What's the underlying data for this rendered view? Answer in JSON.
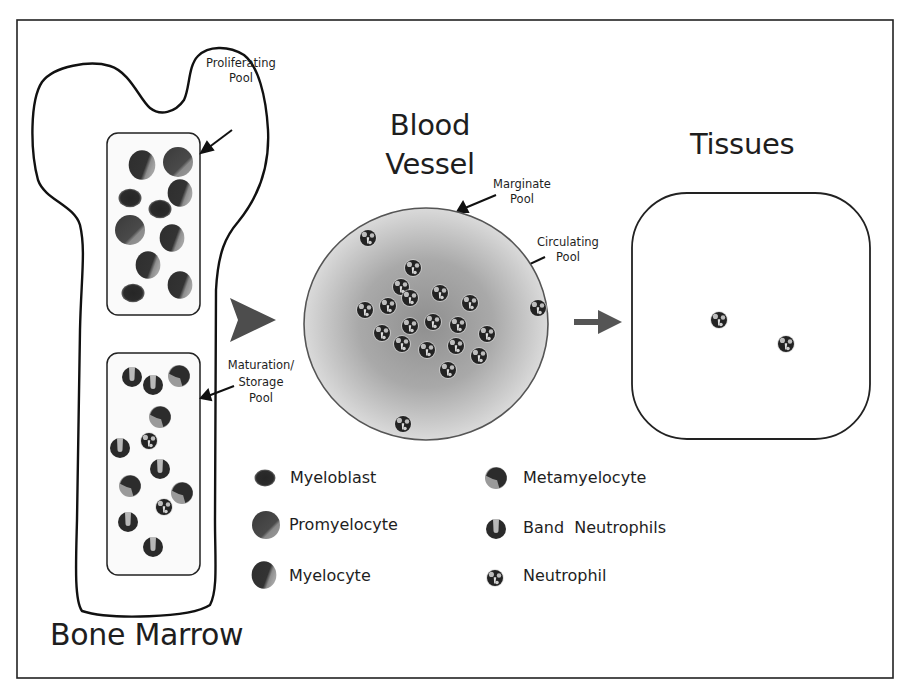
{
  "colors": {
    "outline": "#111111",
    "arrow_fill": "#555555",
    "vessel_center": "#9a9a9a",
    "vessel_edge": "#d9d9d9",
    "cell_dark": "#2a2a2a",
    "cell_light": "#a8a8a8"
  },
  "compartments": {
    "bone_marrow": {
      "title": "Bone Marrow",
      "proliferating_pool": {
        "label_line1": "Proliferating",
        "label_line2": "Pool",
        "cells": [
          {
            "type": "myelocyte",
            "x": 142,
            "y": 165,
            "r": 14
          },
          {
            "type": "promyelocyte",
            "x": 178,
            "y": 162,
            "r": 15
          },
          {
            "type": "myelocyte",
            "x": 180,
            "y": 193,
            "r": 13
          },
          {
            "type": "myeloblast",
            "x": 130,
            "y": 198,
            "r": 11
          },
          {
            "type": "myeloblast",
            "x": 160,
            "y": 209,
            "r": 11
          },
          {
            "type": "promyelocyte",
            "x": 130,
            "y": 230,
            "r": 15
          },
          {
            "type": "myelocyte",
            "x": 172,
            "y": 238,
            "r": 13
          },
          {
            "type": "myelocyte",
            "x": 148,
            "y": 265,
            "r": 13
          },
          {
            "type": "myelocyte",
            "x": 180,
            "y": 285,
            "r": 13
          },
          {
            "type": "myeloblast",
            "x": 133,
            "y": 293,
            "r": 11
          }
        ]
      },
      "maturation_pool": {
        "label_line1": "Maturation/",
        "label_line2": "Storage",
        "label_line3": "Pool",
        "cells": [
          {
            "type": "band",
            "x": 132,
            "y": 377,
            "r": 10
          },
          {
            "type": "band",
            "x": 153,
            "y": 385,
            "r": 10
          },
          {
            "type": "metamyelocyte",
            "x": 179,
            "y": 376,
            "r": 11
          },
          {
            "type": "metamyelocyte",
            "x": 160,
            "y": 417,
            "r": 11
          },
          {
            "type": "band",
            "x": 120,
            "y": 448,
            "r": 10
          },
          {
            "type": "neutrophil",
            "x": 149,
            "y": 441,
            "r": 8
          },
          {
            "type": "band",
            "x": 160,
            "y": 469,
            "r": 10
          },
          {
            "type": "metamyelocyte",
            "x": 130,
            "y": 486,
            "r": 11
          },
          {
            "type": "metamyelocyte",
            "x": 182,
            "y": 493,
            "r": 11
          },
          {
            "type": "neutrophil",
            "x": 164,
            "y": 507,
            "r": 8
          },
          {
            "type": "band",
            "x": 128,
            "y": 522,
            "r": 10
          },
          {
            "type": "band",
            "x": 153,
            "y": 547,
            "r": 10
          }
        ]
      }
    },
    "blood_vessel": {
      "title_line1": "Blood",
      "title_line2": "Vessel",
      "marginate_label_line1": "Marginate",
      "marginate_label_line2": "Pool",
      "circulating_label_line1": "Circulating",
      "circulating_label_line2": "Pool",
      "cells": [
        {
          "type": "neutrophil",
          "x": 368,
          "y": 238,
          "r": 8
        },
        {
          "type": "neutrophil",
          "x": 413,
          "y": 268,
          "r": 8
        },
        {
          "type": "neutrophil",
          "x": 401,
          "y": 287,
          "r": 8
        },
        {
          "type": "neutrophil",
          "x": 410,
          "y": 298,
          "r": 8
        },
        {
          "type": "neutrophil",
          "x": 440,
          "y": 293,
          "r": 8
        },
        {
          "type": "neutrophil",
          "x": 470,
          "y": 303,
          "r": 8
        },
        {
          "type": "neutrophil",
          "x": 365,
          "y": 310,
          "r": 8
        },
        {
          "type": "neutrophil",
          "x": 388,
          "y": 306,
          "r": 8
        },
        {
          "type": "neutrophil",
          "x": 410,
          "y": 326,
          "r": 8
        },
        {
          "type": "neutrophil",
          "x": 433,
          "y": 322,
          "r": 8
        },
        {
          "type": "neutrophil",
          "x": 458,
          "y": 325,
          "r": 8
        },
        {
          "type": "neutrophil",
          "x": 487,
          "y": 334,
          "r": 8
        },
        {
          "type": "neutrophil",
          "x": 382,
          "y": 333,
          "r": 8
        },
        {
          "type": "neutrophil",
          "x": 402,
          "y": 344,
          "r": 8
        },
        {
          "type": "neutrophil",
          "x": 427,
          "y": 350,
          "r": 8
        },
        {
          "type": "neutrophil",
          "x": 456,
          "y": 346,
          "r": 8
        },
        {
          "type": "neutrophil",
          "x": 479,
          "y": 356,
          "r": 8
        },
        {
          "type": "neutrophil",
          "x": 448,
          "y": 370,
          "r": 8
        },
        {
          "type": "neutrophil",
          "x": 538,
          "y": 308,
          "r": 8
        },
        {
          "type": "neutrophil",
          "x": 403,
          "y": 424,
          "r": 8
        }
      ]
    },
    "tissues": {
      "title": "Tissues",
      "cells": [
        {
          "type": "neutrophil",
          "x": 719,
          "y": 320,
          "r": 8
        },
        {
          "type": "neutrophil",
          "x": 786,
          "y": 344,
          "r": 8
        }
      ]
    }
  },
  "legend": {
    "items": [
      {
        "type": "myeloblast",
        "label": "Myeloblast",
        "x": 265,
        "y": 478,
        "r": 10
      },
      {
        "type": "promyelocyte",
        "label": "Promyelocyte",
        "x": 266,
        "y": 525,
        "r": 14
      },
      {
        "type": "myelocyte",
        "label": "Myelocyte",
        "x": 264,
        "y": 575,
        "r": 13
      },
      {
        "type": "metamyelocyte",
        "label": "Metamyelocyte",
        "x": 496,
        "y": 478,
        "r": 11
      },
      {
        "type": "band",
        "label": "Band  Neutrophils",
        "x": 496,
        "y": 529,
        "r": 10
      },
      {
        "type": "neutrophil",
        "label": "Neutrophil",
        "x": 495,
        "y": 578,
        "r": 8
      }
    ]
  }
}
